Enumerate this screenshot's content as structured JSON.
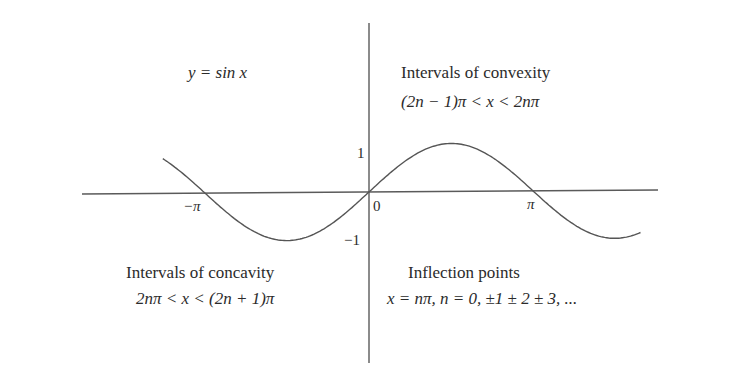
{
  "figure": {
    "title_equation": "y = sin x",
    "colors": {
      "background": "#ffffff",
      "curve": "#555555",
      "axis": "#555555",
      "text": "#2b2b2b"
    },
    "axes": {
      "x_ticks": [
        {
          "label": "−π",
          "value": -3.14159
        },
        {
          "label": "0",
          "value": 0
        },
        {
          "label": "π",
          "value": 3.14159
        }
      ],
      "y_ticks": [
        {
          "label": "1",
          "value": 1
        },
        {
          "label": "−1",
          "value": -1
        }
      ]
    },
    "annotations": {
      "convexity": {
        "title": "Intervals of convexity",
        "formula": "(2n − 1)π < x < 2nπ"
      },
      "concavity": {
        "title": "Intervals of concavity",
        "formula": "2nπ < x < (2n + 1)π"
      },
      "inflection": {
        "title": "Inflection points",
        "formula": "x = nπ,  n = 0, ±1 ± 2 ± 3, ..."
      }
    }
  },
  "chart_data": {
    "type": "line",
    "title": "y = sin x",
    "xlabel": "",
    "ylabel": "",
    "xlim": [
      -3.95,
      2.04
    ],
    "ylim": [
      -1,
      1
    ],
    "grid": false,
    "x_tick_labels": [
      "−π",
      "0",
      "π"
    ],
    "y_tick_labels": [
      "1",
      "−1"
    ],
    "series": [
      {
        "name": "sin x",
        "x": [
          -3.95,
          -3.14159,
          -1.5708,
          0,
          1.5708,
          3.14159,
          4.71239,
          5.2
        ],
        "y": [
          0.72,
          0,
          -1,
          0,
          1,
          0,
          -1,
          -0.88
        ]
      }
    ],
    "annotations": [
      "Intervals of convexity: (2n − 1)π < x < 2nπ",
      "Intervals of concavity: 2nπ < x < (2n + 1)π",
      "Inflection points: x = nπ, n = 0, ±1 ± 2 ± 3, ..."
    ]
  }
}
